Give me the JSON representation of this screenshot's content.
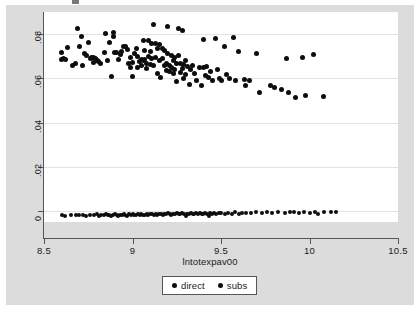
{
  "chart_data": {
    "type": "scatter",
    "title": "",
    "xlabel": "lntotexpav00",
    "ylabel": "",
    "xlim": [
      8.5,
      10.5
    ],
    "ylim": [
      -0.005,
      0.09
    ],
    "grid": true,
    "x_ticks": [
      "8.5",
      "9",
      "9.5",
      "10",
      "10.5"
    ],
    "x_tick_values": [
      8.5,
      9,
      9.5,
      10,
      10.5
    ],
    "y_ticks": [
      "0",
      ".02",
      ".04",
      ".06",
      ".08"
    ],
    "y_tick_values": [
      0,
      0.02,
      0.04,
      0.06,
      0.08
    ],
    "legend_position": "bottom-center",
    "series": [
      {
        "name": "direct",
        "marker": "filled-circle",
        "color": "#0d0d0d",
        "points": [
          [
            8.6,
            0.0718
          ],
          [
            8.6,
            0.0686
          ],
          [
            8.61,
            0.069
          ],
          [
            8.62,
            0.0683
          ],
          [
            8.63,
            0.0738
          ],
          [
            8.66,
            0.066
          ],
          [
            8.68,
            0.0666
          ],
          [
            8.69,
            0.0826
          ],
          [
            8.7,
            0.0745
          ],
          [
            8.71,
            0.079
          ],
          [
            8.72,
            0.0659
          ],
          [
            8.73,
            0.0711
          ],
          [
            8.74,
            0.0703
          ],
          [
            8.75,
            0.0762
          ],
          [
            8.76,
            0.0688
          ],
          [
            8.77,
            0.0696
          ],
          [
            8.78,
            0.0673
          ],
          [
            8.78,
            0.0693
          ],
          [
            8.79,
            0.0689
          ],
          [
            8.8,
            0.0681
          ],
          [
            8.81,
            0.0676
          ],
          [
            8.82,
            0.0668
          ],
          [
            8.84,
            0.0717
          ],
          [
            8.85,
            0.0801
          ],
          [
            8.86,
            0.068
          ],
          [
            8.87,
            0.0761
          ],
          [
            8.88,
            0.0608
          ],
          [
            8.89,
            0.0806
          ],
          [
            8.89,
            0.0788
          ],
          [
            8.9,
            0.0719
          ],
          [
            8.91,
            0.0717
          ],
          [
            8.92,
            0.0683
          ],
          [
            8.93,
            0.071
          ],
          [
            8.94,
            0.0723
          ],
          [
            8.95,
            0.0742
          ],
          [
            8.96,
            0.0746
          ],
          [
            8.97,
            0.0731
          ],
          [
            8.98,
            0.0666
          ],
          [
            8.99,
            0.0692
          ],
          [
            8.99,
            0.0651
          ],
          [
            9.0,
            0.0671
          ],
          [
            9.0,
            0.061
          ],
          [
            9.01,
            0.0714
          ],
          [
            9.02,
            0.0733
          ],
          [
            9.03,
            0.07
          ],
          [
            9.03,
            0.0647
          ],
          [
            9.04,
            0.0677
          ],
          [
            9.05,
            0.0684
          ],
          [
            9.05,
            0.0656
          ],
          [
            9.06,
            0.077
          ],
          [
            9.06,
            0.0682
          ],
          [
            9.07,
            0.0728
          ],
          [
            9.07,
            0.0686
          ],
          [
            9.08,
            0.0665
          ],
          [
            9.08,
            0.0644
          ],
          [
            9.09,
            0.0773
          ],
          [
            9.09,
            0.07
          ],
          [
            9.1,
            0.0721
          ],
          [
            9.1,
            0.0664
          ],
          [
            9.11,
            0.0758
          ],
          [
            9.11,
            0.0688
          ],
          [
            9.12,
            0.0659
          ],
          [
            9.12,
            0.0845
          ],
          [
            9.13,
            0.0757
          ],
          [
            9.13,
            0.0694
          ],
          [
            9.14,
            0.0737
          ],
          [
            9.14,
            0.0624
          ],
          [
            9.15,
            0.0751
          ],
          [
            9.15,
            0.0679
          ],
          [
            9.16,
            0.0604
          ],
          [
            9.17,
            0.0733
          ],
          [
            9.17,
            0.069
          ],
          [
            9.18,
            0.0727
          ],
          [
            9.18,
            0.0656
          ],
          [
            9.19,
            0.0669
          ],
          [
            9.19,
            0.0636
          ],
          [
            9.2,
            0.0834
          ],
          [
            9.2,
            0.0712
          ],
          [
            9.21,
            0.0657
          ],
          [
            9.21,
            0.063
          ],
          [
            9.22,
            0.0702
          ],
          [
            9.22,
            0.0648
          ],
          [
            9.23,
            0.0681
          ],
          [
            9.23,
            0.0622
          ],
          [
            9.24,
            0.0693
          ],
          [
            9.24,
            0.0641
          ],
          [
            9.25,
            0.0665
          ],
          [
            9.25,
            0.0585
          ],
          [
            9.26,
            0.0824
          ],
          [
            9.26,
            0.0703
          ],
          [
            9.27,
            0.0668
          ],
          [
            9.27,
            0.0626
          ],
          [
            9.28,
            0.0818
          ],
          [
            9.28,
            0.0645
          ],
          [
            9.29,
            0.0662
          ],
          [
            9.29,
            0.06
          ],
          [
            9.3,
            0.0681
          ],
          [
            9.3,
            0.0616
          ],
          [
            9.31,
            0.0655
          ],
          [
            9.32,
            0.0572
          ],
          [
            9.33,
            0.0642
          ],
          [
            9.34,
            0.066
          ],
          [
            9.35,
            0.0624
          ],
          [
            9.36,
            0.0588
          ],
          [
            9.38,
            0.0648
          ],
          [
            9.39,
            0.0566
          ],
          [
            9.4,
            0.0776
          ],
          [
            9.4,
            0.065
          ],
          [
            9.41,
            0.0615
          ],
          [
            9.42,
            0.0654
          ],
          [
            9.43,
            0.0604
          ],
          [
            9.44,
            0.0632
          ],
          [
            9.45,
            0.059
          ],
          [
            9.47,
            0.0782
          ],
          [
            9.48,
            0.0641
          ],
          [
            9.49,
            0.0597
          ],
          [
            9.5,
            0.0588
          ],
          [
            9.52,
            0.0745
          ],
          [
            9.53,
            0.0619
          ],
          [
            9.55,
            0.0597
          ],
          [
            9.57,
            0.0783
          ],
          [
            9.58,
            0.0591
          ],
          [
            9.6,
            0.0723
          ],
          [
            9.63,
            0.0596
          ],
          [
            9.64,
            0.0567
          ],
          [
            9.66,
            0.0592
          ],
          [
            9.7,
            0.0712
          ],
          [
            9.72,
            0.0535
          ],
          [
            9.78,
            0.0566
          ],
          [
            9.8,
            0.0558
          ],
          [
            9.84,
            0.0551
          ],
          [
            9.87,
            0.0691
          ],
          [
            9.88,
            0.0534
          ],
          [
            9.92,
            0.0512
          ],
          [
            9.96,
            0.0695
          ],
          [
            9.98,
            0.0522
          ],
          [
            10.02,
            0.0707
          ],
          [
            10.08,
            0.0517
          ]
        ]
      },
      {
        "name": "subs",
        "marker": "filled-circle",
        "color": "#0d0d0d",
        "points": [
          [
            8.6,
            -0.0019
          ],
          [
            8.62,
            -0.0021
          ],
          [
            8.65,
            -0.0018
          ],
          [
            8.68,
            -0.002
          ],
          [
            8.7,
            -0.0017
          ],
          [
            8.72,
            -0.0019
          ],
          [
            8.74,
            -0.0022
          ],
          [
            8.76,
            -0.0018
          ],
          [
            8.78,
            -0.002
          ],
          [
            8.8,
            -0.0016
          ],
          [
            8.81,
            -0.0021
          ],
          [
            8.82,
            -0.0018
          ],
          [
            8.84,
            -0.0019
          ],
          [
            8.85,
            -0.0015
          ],
          [
            8.86,
            -0.002
          ],
          [
            8.87,
            -0.0017
          ],
          [
            8.88,
            -0.0021
          ],
          [
            8.89,
            -0.0018
          ],
          [
            8.9,
            -0.0016
          ],
          [
            8.91,
            -0.0019
          ],
          [
            8.92,
            -0.0022
          ],
          [
            8.93,
            -0.0017
          ],
          [
            8.94,
            -0.002
          ],
          [
            8.95,
            -0.0015
          ],
          [
            8.96,
            -0.0018
          ],
          [
            8.97,
            -0.0021
          ],
          [
            8.98,
            -0.0016
          ],
          [
            8.99,
            -0.0019
          ],
          [
            9.0,
            -0.0014
          ],
          [
            9.01,
            -0.0018
          ],
          [
            9.02,
            -0.002
          ],
          [
            9.03,
            -0.0016
          ],
          [
            9.04,
            -0.0019
          ],
          [
            9.05,
            -0.0013
          ],
          [
            9.06,
            -0.0017
          ],
          [
            9.07,
            -0.002
          ],
          [
            9.08,
            -0.0015
          ],
          [
            9.09,
            -0.0018
          ],
          [
            9.1,
            -0.0013
          ],
          [
            9.11,
            -0.0016
          ],
          [
            9.12,
            -0.0019
          ],
          [
            9.13,
            -0.0014
          ],
          [
            9.14,
            -0.0017
          ],
          [
            9.15,
            -0.0012
          ],
          [
            9.16,
            -0.0015
          ],
          [
            9.17,
            -0.0018
          ],
          [
            9.18,
            -0.0013
          ],
          [
            9.19,
            -0.0016
          ],
          [
            9.2,
            -0.0011
          ],
          [
            9.21,
            -0.0014
          ],
          [
            9.22,
            -0.0017
          ],
          [
            9.23,
            -0.0012
          ],
          [
            9.24,
            -0.0015
          ],
          [
            9.25,
            -0.001
          ],
          [
            9.26,
            -0.0013
          ],
          [
            9.27,
            -0.0016
          ],
          [
            9.28,
            -0.0011
          ],
          [
            9.29,
            -0.0014
          ],
          [
            9.3,
            -0.0024
          ],
          [
            9.31,
            -0.0012
          ],
          [
            9.32,
            -0.0015
          ],
          [
            9.33,
            -0.001
          ],
          [
            9.34,
            -0.0013
          ],
          [
            9.35,
            -0.0016
          ],
          [
            9.36,
            -0.0011
          ],
          [
            9.37,
            -0.0014
          ],
          [
            9.38,
            -0.0009
          ],
          [
            9.39,
            -0.0012
          ],
          [
            9.4,
            -0.0015
          ],
          [
            9.41,
            -0.001
          ],
          [
            9.42,
            -0.0013
          ],
          [
            9.43,
            -0.0021
          ],
          [
            9.44,
            -0.0011
          ],
          [
            9.45,
            -0.0014
          ],
          [
            9.46,
            -0.0009
          ],
          [
            9.47,
            -0.0012
          ],
          [
            9.49,
            -0.0008
          ],
          [
            9.5,
            -0.0011
          ],
          [
            9.52,
            -0.0014
          ],
          [
            9.54,
            -0.0009
          ],
          [
            9.56,
            -0.0012
          ],
          [
            9.58,
            -0.0007
          ],
          [
            9.6,
            -0.0013
          ],
          [
            9.62,
            -0.001
          ],
          [
            9.64,
            -0.0008
          ],
          [
            9.67,
            -0.0011
          ],
          [
            9.7,
            -0.0006
          ],
          [
            9.73,
            -0.0009
          ],
          [
            9.76,
            -0.0007
          ],
          [
            9.79,
            -0.001
          ],
          [
            9.82,
            -0.0005
          ],
          [
            9.86,
            -0.0008
          ],
          [
            9.89,
            -0.0004
          ],
          [
            9.91,
            -0.0007
          ],
          [
            9.94,
            -0.0009
          ],
          [
            9.97,
            -0.0005
          ],
          [
            10.0,
            -0.0008
          ],
          [
            10.03,
            -0.0003
          ],
          [
            10.05,
            -0.0012
          ],
          [
            10.08,
            -0.0006
          ],
          [
            10.12,
            -0.0004
          ],
          [
            10.15,
            -0.0007
          ]
        ]
      }
    ]
  },
  "axis": {
    "x_title": "lntotexpav00"
  },
  "legend": {
    "entries": [
      {
        "label": "direct"
      },
      {
        "label": "subs"
      }
    ]
  },
  "colors": {
    "marker": "#0d0d0d",
    "graph_background": "#dcdcdc",
    "plot_background": "#ffffff",
    "gridline": "#e2e2e2",
    "axis": "#555555"
  }
}
